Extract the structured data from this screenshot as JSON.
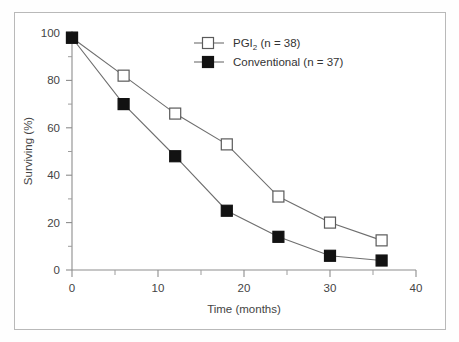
{
  "chart_data": {
    "type": "line",
    "title": "",
    "xlabel": "Time (months)",
    "ylabel": "Surviving (%)",
    "xlim": [
      0,
      40
    ],
    "ylim": [
      0,
      100
    ],
    "x": [
      0,
      6,
      12,
      18,
      24,
      30,
      36
    ],
    "xticks": [
      0,
      10,
      20,
      30,
      40
    ],
    "xtick_labels": [
      "0",
      "10",
      "20",
      "30",
      "40"
    ],
    "xminor_ticks": [
      5,
      15,
      25,
      35
    ],
    "yticks": [
      0,
      20,
      40,
      60,
      80,
      100
    ],
    "ytick_labels": [
      "0",
      "20",
      "40",
      "60",
      "80",
      "100"
    ],
    "yminor_ticks": [
      10,
      30,
      50,
      70,
      90
    ],
    "grid": false,
    "legend_position": "upper-center",
    "series": [
      {
        "name": "PGI2 (n = 38)",
        "label_main": "PGI",
        "label_sub": "2",
        "label_tail": " (n = 38)",
        "marker": "open-square",
        "values": [
          98,
          82,
          66,
          53,
          31,
          20,
          12.5
        ]
      },
      {
        "name": "Conventional (n = 37)",
        "label_main": "Conventional (n = 37)",
        "label_sub": "",
        "label_tail": "",
        "marker": "filled-square",
        "values": [
          98,
          70,
          48,
          25,
          14,
          6,
          4
        ]
      }
    ]
  },
  "legend": {
    "item1_main": "PGI",
    "item1_sub": "2",
    "item1_tail": " (n = 38)",
    "item2_main": "Conventional (n = 37)"
  },
  "axes": {
    "x_title": "Time (months)",
    "y_title": "Surviving (%)",
    "x_labels": [
      "0",
      "10",
      "20",
      "30",
      "40"
    ],
    "y_labels": [
      "0",
      "20",
      "40",
      "60",
      "80",
      "100"
    ]
  },
  "colors": {
    "line": "#6e6e6e",
    "axis": "#8d8d8d",
    "marker_filled": "#121212",
    "marker_open_stroke": "#5a5a5a",
    "frame": "#b9b9b9",
    "background": "#ffffff",
    "text": "#444444"
  }
}
